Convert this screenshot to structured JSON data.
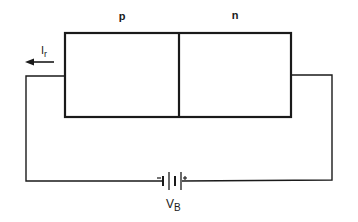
{
  "diagram": {
    "type": "circuit",
    "regions": [
      {
        "label": "p"
      },
      {
        "label": "n"
      }
    ],
    "current": {
      "symbol": "I",
      "subscript": "r",
      "direction": "left"
    },
    "battery": {
      "symbol": "V",
      "subscript": "B",
      "negative": "−",
      "positive": "+"
    },
    "colors": {
      "line": "#1a1a1a",
      "background": "#ffffff"
    }
  }
}
